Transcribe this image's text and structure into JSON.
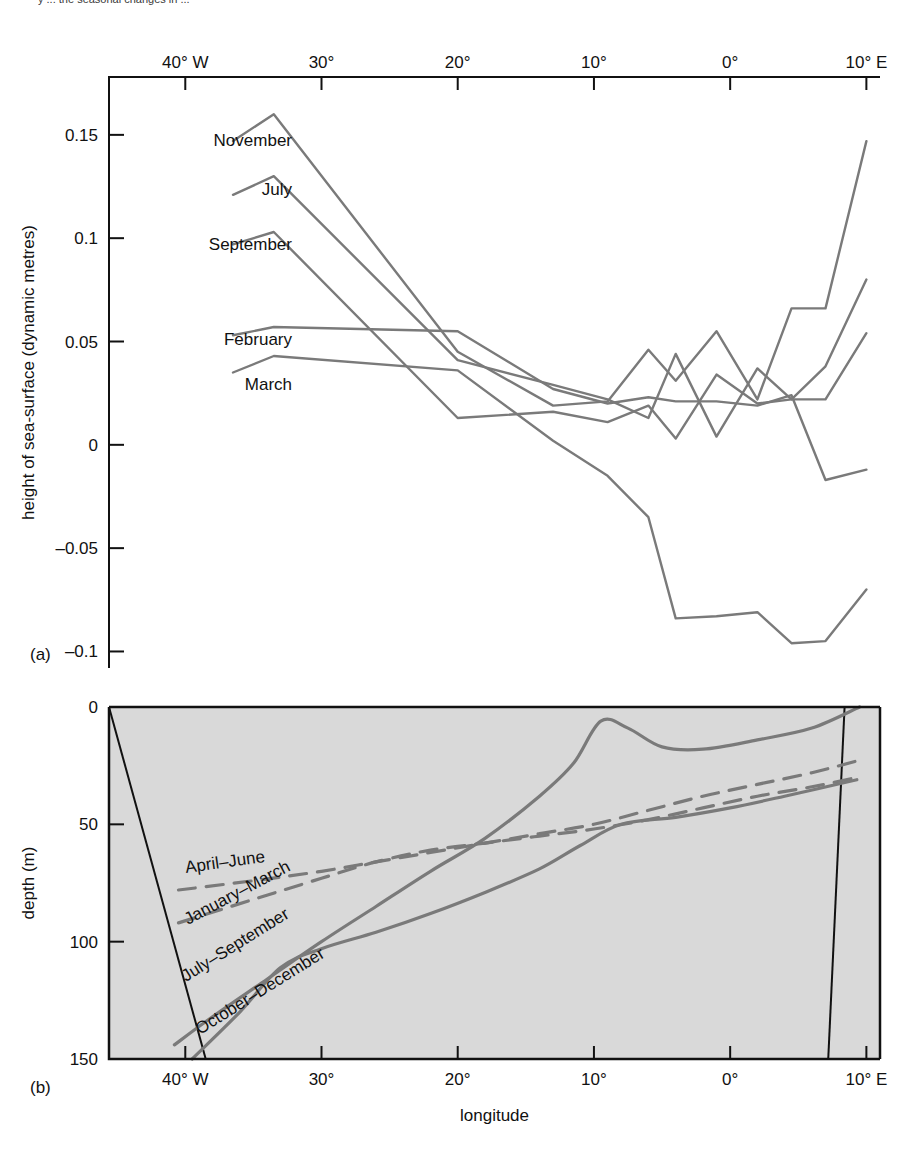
{
  "figure": {
    "cropped_header_text": "y   ... the seasonal changes in ...",
    "panel_a_tag": "(a)",
    "panel_b_tag": "(b)",
    "line_color": "#7a7a7a",
    "axis_color": "#111111",
    "panel_b_fill": "#d9d9d9"
  },
  "chart_data": [
    {
      "type": "line",
      "title": "",
      "panel": "(a)",
      "xlabel": "",
      "ylabel": "height of sea-surface  (dynamic metres)",
      "x_axis_position": "top",
      "xlim": [
        -45.6,
        11.0
      ],
      "ylim": [
        -0.108,
        0.178
      ],
      "ytick_labels": [
        "0.15",
        "0.1",
        "0.05",
        "0",
        "-0.05",
        "-0.1"
      ],
      "ytick_values": [
        0.15,
        0.1,
        0.05,
        0,
        -0.05,
        -0.1
      ],
      "xtick_labels": [
        "40° W",
        "30°",
        "20°",
        "10°",
        "0°",
        "10° E"
      ],
      "xtick_values": [
        -40,
        -30,
        -20,
        -10,
        0,
        10
      ],
      "grid": false,
      "legend": "inline-labels-left",
      "series": [
        {
          "name": "November",
          "x": [
            -36.5,
            -33.5,
            -20.0,
            -13.0,
            -9.0,
            -6.0,
            -4.0,
            -1.0,
            2.0,
            4.5,
            7.0,
            10.0
          ],
          "y": [
            0.147,
            0.16,
            0.045,
            0.019,
            0.021,
            0.046,
            0.031,
            0.055,
            0.022,
            0.066,
            0.066,
            0.147
          ]
        },
        {
          "name": "July",
          "x": [
            -36.5,
            -33.5,
            -20.0,
            -13.0,
            -9.0,
            -6.0,
            -4.0,
            -1.0,
            2.0,
            4.5,
            7.0,
            10.0
          ],
          "y": [
            0.121,
            0.13,
            0.041,
            0.029,
            0.022,
            0.013,
            0.044,
            0.004,
            0.037,
            0.022,
            0.038,
            0.08
          ]
        },
        {
          "name": "September",
          "x": [
            -36.5,
            -33.5,
            -20.0,
            -13.0,
            -9.0,
            -6.0,
            -4.0,
            -1.0,
            2.0,
            4.5,
            7.0,
            10.0
          ],
          "y": [
            0.097,
            0.103,
            0.013,
            0.016,
            0.011,
            0.019,
            0.003,
            0.034,
            0.02,
            0.022,
            0.022,
            0.054
          ]
        },
        {
          "name": "February",
          "x": [
            -36.5,
            -33.5,
            -20.0,
            -13.0,
            -9.0,
            -6.0,
            -4.0,
            -1.0,
            2.0,
            4.5,
            7.0,
            10.0
          ],
          "y": [
            0.053,
            0.057,
            0.055,
            0.027,
            0.02,
            0.023,
            0.021,
            0.021,
            0.019,
            0.024,
            -0.017,
            -0.012
          ]
        },
        {
          "name": "March",
          "x": [
            -36.5,
            -33.5,
            -20.0,
            -13.0,
            -9.0,
            -6.0,
            -4.0,
            -1.0,
            2.0,
            4.5,
            7.0,
            10.0
          ],
          "y": [
            0.035,
            0.043,
            0.036,
            0.002,
            -0.015,
            -0.035,
            -0.084,
            -0.083,
            -0.081,
            -0.096,
            -0.095,
            -0.07
          ]
        }
      ],
      "series_labels": [
        "November",
        "July",
        "September",
        "February",
        "March"
      ]
    },
    {
      "type": "line",
      "panel": "(b)",
      "title": "",
      "xlabel": "longitude",
      "ylabel": "depth (m)",
      "y_inverted": true,
      "xlim": [
        -45.6,
        11.0
      ],
      "ylim": [
        0,
        150
      ],
      "ytick_labels": [
        "0",
        "50",
        "100",
        "150"
      ],
      "ytick_values": [
        0,
        50,
        100,
        150
      ],
      "xtick_labels": [
        "40° W",
        "30°",
        "20°",
        "10°",
        "0°",
        "10° E"
      ],
      "xtick_values": [
        -40,
        -30,
        -20,
        -10,
        0,
        10
      ],
      "grid": false,
      "background_shaded": true,
      "legend": "inline-rotated-labels",
      "series": [
        {
          "name": "April–June",
          "style": "dashed",
          "x": [
            -40.5,
            -35.0,
            -30.0,
            -26.0,
            -22.0,
            -18.0,
            -14.0,
            -10.0,
            -6.0,
            -2.0,
            2.0,
            6.0,
            9.3
          ],
          "y": [
            78,
            74,
            70,
            66,
            62,
            58,
            54,
            50,
            44,
            38,
            33,
            28,
            23
          ]
        },
        {
          "name": "January–March",
          "style": "dashed",
          "x": [
            -40.5,
            -35.0,
            -30.0,
            -26.0,
            -22.0,
            -18.0,
            -14.0,
            -10.0,
            -6.0,
            -2.0,
            2.0,
            6.0,
            9.3
          ],
          "y": [
            92,
            82,
            73,
            66,
            61,
            58,
            55,
            52,
            48,
            43,
            38,
            34,
            30
          ]
        },
        {
          "name": "July–September",
          "style": "solid",
          "x": [
            -40.8,
            -38.0,
            -34.0,
            -30.0,
            -26.0,
            -22.0,
            -18.0,
            -14.0,
            -11.5,
            -9.5,
            -7.5,
            -5.0,
            -2.0,
            2.0,
            6.0,
            9.5
          ],
          "y": [
            144,
            132,
            116,
            100,
            85,
            70,
            56,
            38,
            24,
            6,
            9,
            17,
            18,
            14,
            9,
            0
          ]
        },
        {
          "name": "October–December",
          "style": "solid",
          "x": [
            -39.5,
            -36.0,
            -33.0,
            -30.0,
            -26.0,
            -22.0,
            -18.0,
            -14.0,
            -11.0,
            -8.0,
            -4.0,
            0.0,
            4.0,
            9.3
          ],
          "y": [
            150,
            130,
            111,
            103,
            96,
            88,
            79,
            69,
            59,
            50,
            47,
            43,
            38,
            31
          ]
        }
      ],
      "boundary_lines": [
        {
          "name": "left-shelf-boundary",
          "x": [
            -45.6,
            -38.5
          ],
          "y": [
            0,
            150
          ]
        },
        {
          "name": "right-shelf-boundary",
          "x": [
            8.4,
            7.2
          ],
          "y": [
            0,
            150
          ]
        }
      ]
    }
  ]
}
